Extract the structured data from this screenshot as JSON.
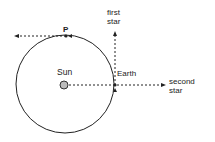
{
  "diagram": {
    "labels": {
      "p": "P",
      "sun": "Sun",
      "earth": "Earth",
      "first_star_line1": "first",
      "first_star_line2": "star",
      "second_star_line1": "second",
      "second_star_line2": "star"
    },
    "colors": {
      "line": "#222222",
      "sun_fill": "#bbbbbb"
    },
    "orbit": {
      "cx": 65,
      "cy": 84,
      "r": 49
    }
  }
}
